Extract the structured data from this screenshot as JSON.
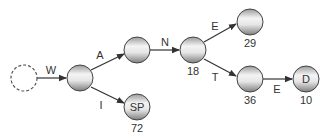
{
  "diagram": {
    "type": "trie",
    "nodes": [
      {
        "id": "root",
        "style": "dashed",
        "text": "",
        "count": ""
      },
      {
        "id": "w",
        "style": "solid",
        "text": "",
        "count": ""
      },
      {
        "id": "wa",
        "style": "solid",
        "text": "",
        "count": ""
      },
      {
        "id": "wan",
        "style": "solid",
        "text": "",
        "count": "18"
      },
      {
        "id": "wane",
        "style": "solid",
        "text": "",
        "count": "29"
      },
      {
        "id": "want",
        "style": "solid",
        "text": "",
        "count": "36"
      },
      {
        "id": "wanted",
        "style": "solid",
        "text": "D",
        "count": "10"
      },
      {
        "id": "wisp",
        "style": "solid",
        "text": "SP",
        "count": "72"
      }
    ],
    "edges": [
      {
        "from": "root",
        "to": "w",
        "label": "W"
      },
      {
        "from": "w",
        "to": "wa",
        "label": "A"
      },
      {
        "from": "w",
        "to": "wisp",
        "label": "I"
      },
      {
        "from": "wa",
        "to": "wan",
        "label": "N"
      },
      {
        "from": "wan",
        "to": "wane",
        "label": "E"
      },
      {
        "from": "wan",
        "to": "want",
        "label": "T"
      },
      {
        "from": "want",
        "to": "wanted",
        "label": "E"
      }
    ],
    "colors": {
      "line": "#333333",
      "node_light": "#f2f2f2",
      "node_dark": "#8a8a8a"
    }
  }
}
